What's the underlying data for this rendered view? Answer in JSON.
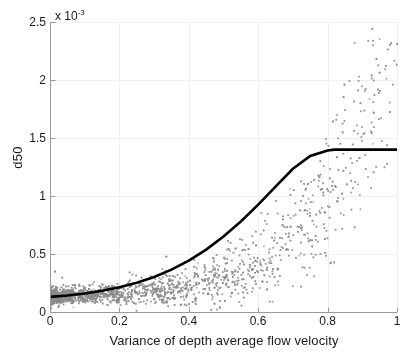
{
  "chart_data": {
    "type": "scatter",
    "title": "",
    "xlabel": "Variance of depth average flow velocity",
    "ylabel": "d50",
    "y_exponent_prefix": "x 10",
    "y_exponent_power": "-3",
    "xlim": [
      0,
      1
    ],
    "ylim": [
      0,
      0.0025
    ],
    "xticks": [
      0,
      0.2,
      0.4,
      0.6,
      0.8,
      1
    ],
    "xticklabels": [
      "0",
      "0.2",
      "0.4",
      "0.6",
      "0.8",
      "1"
    ],
    "yticks": [
      0,
      0.0005,
      0.001,
      0.0015,
      0.002,
      0.0025
    ],
    "yticklabels": [
      "0",
      "0.5",
      "1",
      "1.5",
      "2",
      "2.5"
    ],
    "grid": true,
    "series": [
      {
        "name": "observations",
        "type": "scatter",
        "color": "#8c8c8c",
        "marker_size": 1.6,
        "n_points": 4200,
        "description": "Dense gray point cloud rising from near-zero d50 at low variance to widely scattered values up to about 2.1e-3 near variance 0.65, thinning out beyond variance 0.7.",
        "x_density_peak": 0.13,
        "max_y_observed": 0.00212,
        "spread_model": {
          "mean_a": 0.00013,
          "mean_b": 1.15e-05,
          "mean_c": 5.4,
          "sigma_base": 4e-05,
          "sigma_growth": 0.00052,
          "sigma_power": 2.3
        }
      },
      {
        "name": "fitted curve",
        "type": "line",
        "color": "#000000",
        "line_width": 2.6,
        "description": "Smooth convex exponential rise from 0.13e-3 at x=0 to a knee at x=0.82, y=1.4e-3, then a flat plateau at 1.4e-3 out to x=1.",
        "knee_x": 0.82,
        "knee_y": 0.0014,
        "start_y": 0.00013,
        "plateau_y": 0.0014,
        "curve_points": [
          [
            0.0,
            0.00013
          ],
          [
            0.05,
            0.000142
          ],
          [
            0.1,
            0.00016
          ],
          [
            0.15,
            0.000183
          ],
          [
            0.2,
            0.000213
          ],
          [
            0.25,
            0.000252
          ],
          [
            0.3,
            0.000302
          ],
          [
            0.35,
            0.000365
          ],
          [
            0.4,
            0.000443
          ],
          [
            0.45,
            0.000538
          ],
          [
            0.5,
            0.00065
          ],
          [
            0.55,
            0.00078
          ],
          [
            0.6,
            0.000925
          ],
          [
            0.65,
            0.00108
          ],
          [
            0.7,
            0.001235
          ],
          [
            0.75,
            0.001345
          ],
          [
            0.8,
            0.001393
          ],
          [
            0.82,
            0.0014
          ],
          [
            0.9,
            0.0014
          ],
          [
            1.0,
            0.0014
          ]
        ]
      }
    ]
  },
  "axes": {
    "axis_color": "#9a9a9a",
    "grid_color": "#f0f0f0",
    "text_color": "#1a1a1a",
    "background": "#ffffff"
  }
}
